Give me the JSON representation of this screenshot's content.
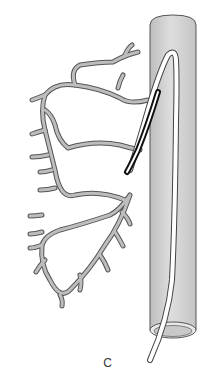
{
  "figure": {
    "panel_label": "C",
    "components": [
      {
        "name": "aorta",
        "kind": "tubular-vessel"
      },
      {
        "name": "coronary-artery-tree",
        "kind": "branching-vessels"
      },
      {
        "name": "guiding-catheter",
        "kind": "catheter"
      },
      {
        "name": "inner-catheter",
        "kind": "catheter-tip-dark-segment"
      }
    ],
    "colors": {
      "aorta_fill": "#cfcfcf",
      "aorta_stroke": "#555555",
      "vessel_fill": "#bdbdbd",
      "vessel_stroke": "#555555",
      "catheter_fill": "#ffffff",
      "catheter_dark": "#111111"
    }
  }
}
